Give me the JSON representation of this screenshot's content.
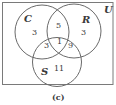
{
  "diagram": {
    "type": "venn",
    "universe_label": "U",
    "caption": "(c)",
    "sets": [
      {
        "name": "C"
      },
      {
        "name": "R"
      },
      {
        "name": "S"
      }
    ],
    "regions": {
      "C_only": "3",
      "R_only": "3",
      "S_only": "11",
      "C_and_R_only": "5",
      "C_and_S_only": "3",
      "R_and_S_only": "9",
      "C_and_R_and_S": "1"
    },
    "colors": {
      "stroke": "#6a6a6a",
      "text": "#3a3a3a",
      "background": "#ffffff"
    }
  }
}
